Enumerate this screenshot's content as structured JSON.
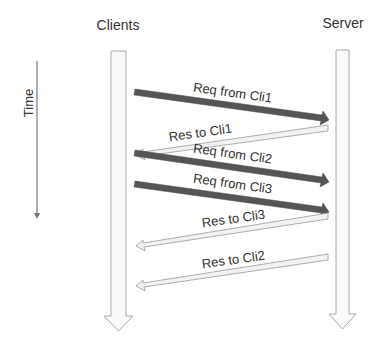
{
  "diagram": {
    "type": "sequence",
    "participants": [
      {
        "id": "clients",
        "label": "Clients"
      },
      {
        "id": "server",
        "label": "Server"
      }
    ],
    "time_axis": {
      "label": "Time",
      "direction": "down"
    },
    "messages": [
      {
        "label": "Req from Cli1",
        "from": "clients",
        "to": "server",
        "style": "dark"
      },
      {
        "label": "Res to Cli1",
        "from": "server",
        "to": "clients",
        "style": "light"
      },
      {
        "label": "Req from Cli2",
        "from": "clients",
        "to": "server",
        "style": "dark"
      },
      {
        "label": "Req from Cli3",
        "from": "clients",
        "to": "server",
        "style": "dark"
      },
      {
        "label": "Res to Cli3",
        "from": "server",
        "to": "clients",
        "style": "light"
      },
      {
        "label": "Res to Cli2",
        "from": "server",
        "to": "clients",
        "style": "light"
      }
    ],
    "colors": {
      "dark_arrow": "#555555",
      "light_arrow_fill": "#f2f2f2",
      "light_arrow_stroke": "#999999",
      "lifeline_fill": "#fafafa",
      "lifeline_stroke": "#aaaaaa",
      "text": "#333333"
    }
  }
}
